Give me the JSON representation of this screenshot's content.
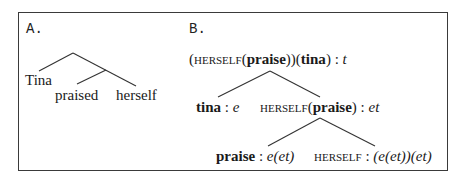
{
  "panels": {
    "a": {
      "label": "A.",
      "words": [
        "Tina",
        "praised",
        "herself"
      ]
    },
    "b": {
      "label": "B.",
      "root": {
        "open": "(",
        "func": "HERSELF",
        "paren_open": "(",
        "arg": "praise",
        "close_inner": "))(",
        "subject": "tina",
        "close": ")",
        "sep": " : ",
        "type": "t"
      },
      "left_child": {
        "term": "tina",
        "sep": " : ",
        "type": "e"
      },
      "right_child": {
        "func": "HERSELF",
        "paren_open": "(",
        "arg": "praise",
        "paren_close": ")",
        "sep": " : ",
        "type": "et"
      },
      "leaf_praise": {
        "term": "praise",
        "sep": " : ",
        "type": "e(et)"
      },
      "leaf_herself": {
        "func": "HERSELF",
        "sep": " : ",
        "type": "(e(et))(et)"
      }
    }
  }
}
